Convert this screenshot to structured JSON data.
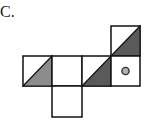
{
  "label": "C.",
  "diagram": {
    "type": "cube-net",
    "cell_size": 29,
    "colors": {
      "stroke": "#111111",
      "fill_light_gray": "#8c8c8c",
      "fill_dark_gray": "#5a5a5a",
      "circle_fill": "#b0b0b0"
    },
    "faces": [
      {
        "id": "top-right",
        "col": 3,
        "row": 0,
        "pattern": "diagonal-bl-tr",
        "shaded": "lower-right",
        "shade": "dark"
      },
      {
        "id": "left",
        "col": 0,
        "row": 1,
        "pattern": "diagonal-bl-tr",
        "shaded": "lower-right",
        "shade": "light"
      },
      {
        "id": "center-left",
        "col": 1,
        "row": 1,
        "pattern": "blank"
      },
      {
        "id": "center-right",
        "col": 2,
        "row": 1,
        "pattern": "diagonal-bl-tr",
        "shaded": "lower-right",
        "shade": "dark"
      },
      {
        "id": "right",
        "col": 3,
        "row": 1,
        "pattern": "circle"
      },
      {
        "id": "bottom",
        "col": 1,
        "row": 2,
        "pattern": "blank"
      }
    ]
  }
}
